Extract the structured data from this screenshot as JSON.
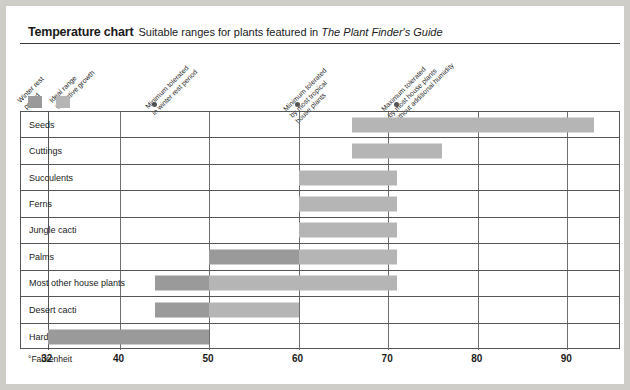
{
  "header": {
    "title": "Temperature chart",
    "subtitle_pre": "Suitable ranges for plants featured in ",
    "subtitle_italic": "The Plant Finder's Guide"
  },
  "legend": {
    "items": [
      {
        "label_line1": "Winter rest",
        "label_line2": "period",
        "color": "#9a9a9a",
        "key": "winter-rest"
      },
      {
        "label_line1": "Ideal range",
        "label_line2": "for active growth",
        "color": "#b5b5b5",
        "key": "ideal-range"
      }
    ]
  },
  "callouts": [
    {
      "key": "min-winter-rest",
      "lines": [
        "Minimum tolerated",
        "in winter rest period"
      ],
      "value": 44
    },
    {
      "key": "min-tropical",
      "lines": [
        "Minimum tolerated",
        "by most tropical",
        "house plants"
      ],
      "value": 60
    },
    {
      "key": "max-house-plants",
      "lines": [
        "Maximum tolerated",
        "by most house plants",
        "without additional humidity"
      ],
      "value": 71
    }
  ],
  "axis": {
    "unit_label": "°Fahrenheit",
    "ticks": [
      32,
      40,
      50,
      60,
      70,
      80,
      90
    ],
    "min": 29,
    "max": 96
  },
  "chart_data": {
    "type": "bar",
    "title": "Temperature chart",
    "subtitle": "Suitable ranges for plants featured in The Plant Finder's Guide",
    "xlabel": "°Fahrenheit",
    "ylabel": "",
    "xlim": [
      29,
      96
    ],
    "grid": true,
    "legend_position": "top-left",
    "orientation": "horizontal",
    "series": [
      {
        "name": "Winter rest period",
        "color": "#9a9a9a"
      },
      {
        "name": "Ideal range for active growth",
        "color": "#b5b5b5"
      }
    ],
    "categories": [
      "Seeds",
      "Cuttings",
      "Succulents",
      "Ferns",
      "Jungle cacti",
      "Palms",
      "Most other house plants",
      "Desert cacti",
      "Hardy bulbs before flowering"
    ],
    "rows": [
      {
        "category": "Seeds",
        "winter_rest": null,
        "ideal_range": [
          66,
          93
        ]
      },
      {
        "category": "Cuttings",
        "winter_rest": null,
        "ideal_range": [
          66,
          76
        ]
      },
      {
        "category": "Succulents",
        "winter_rest": null,
        "ideal_range": [
          60,
          71
        ]
      },
      {
        "category": "Ferns",
        "winter_rest": null,
        "ideal_range": [
          60,
          71
        ]
      },
      {
        "category": "Jungle cacti",
        "winter_rest": null,
        "ideal_range": [
          60,
          71
        ]
      },
      {
        "category": "Palms",
        "winter_rest": [
          50,
          60
        ],
        "ideal_range": [
          60,
          71
        ]
      },
      {
        "category": "Most other house plants",
        "winter_rest": [
          44,
          50
        ],
        "ideal_range": [
          50,
          71
        ]
      },
      {
        "category": "Desert cacti",
        "winter_rest": [
          44,
          50
        ],
        "ideal_range": [
          50,
          60
        ]
      },
      {
        "category": "Hardy bulbs before flowering",
        "winter_rest": [
          32,
          50
        ],
        "ideal_range": null
      }
    ]
  }
}
